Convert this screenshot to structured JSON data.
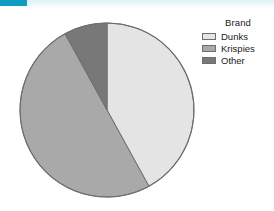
{
  "banner": {
    "accent_color": "#0e9cc0",
    "strip_color": "#ddf2f7"
  },
  "legend": {
    "title": "Brand",
    "position": "right",
    "entries": [
      {
        "label": "Dunks",
        "color": "#e4e4e4"
      },
      {
        "label": "Krispies",
        "color": "#a9a9a9"
      },
      {
        "label": "Other",
        "color": "#787878"
      }
    ]
  },
  "chart_data": {
    "type": "pie",
    "title": "",
    "subtitle": "",
    "xlabel": "",
    "ylabel": "",
    "legend_title": "Brand",
    "legend_position": "right",
    "grid": false,
    "start_angle_deg": 0,
    "direction": "clockwise",
    "categories": [
      "Dunks",
      "Krispies",
      "Other"
    ],
    "values": [
      42,
      50,
      8
    ],
    "units": "percent",
    "colors": [
      "#e4e4e4",
      "#a9a9a9",
      "#787878"
    ],
    "slices": [
      {
        "label": "Dunks",
        "value": 42,
        "percent": 42,
        "angle_deg": 151.2,
        "color": "#e4e4e4"
      },
      {
        "label": "Krispies",
        "value": 50,
        "percent": 50,
        "angle_deg": 180.0,
        "color": "#a9a9a9"
      },
      {
        "label": "Other",
        "value": 8,
        "percent": 8,
        "angle_deg": 28.8,
        "color": "#787878"
      }
    ],
    "annotations": []
  },
  "pie_geometry": {
    "center_x": 93,
    "center_y": 93,
    "radius": 87,
    "outline_color": "#6e6e6e"
  }
}
